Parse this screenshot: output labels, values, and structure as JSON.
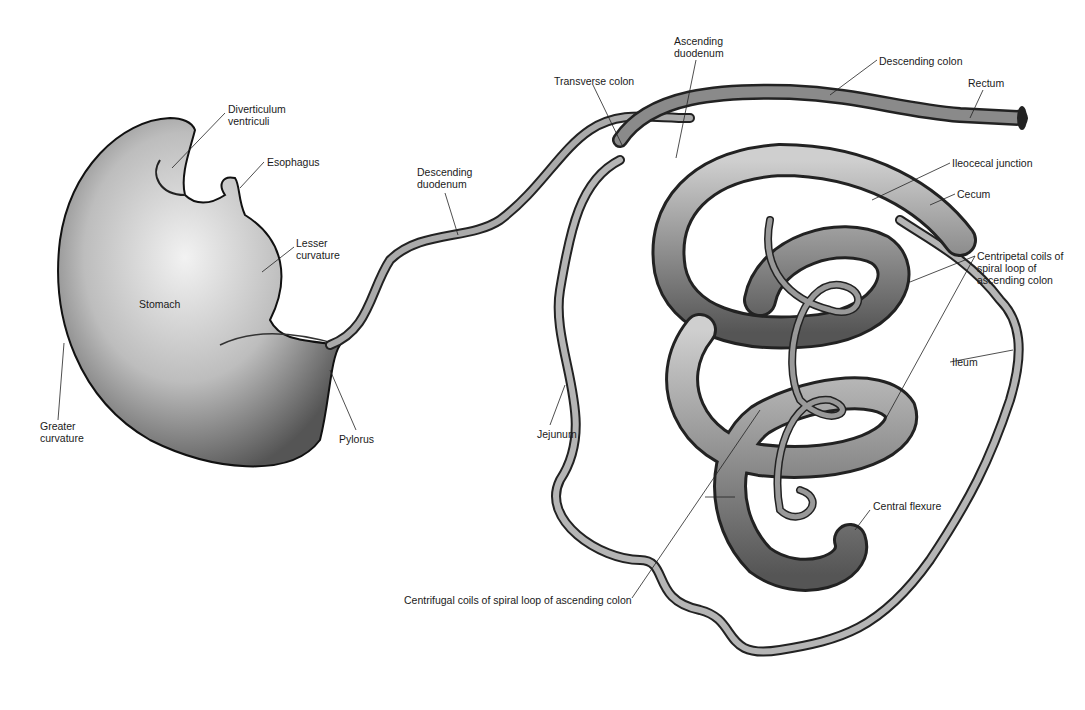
{
  "diagram": {
    "labels": [
      {
        "id": "diverticulum",
        "text": "Diverticulum\nventriculi",
        "x": 228,
        "y": 103
      },
      {
        "id": "esophagus",
        "text": "Esophagus",
        "x": 267,
        "y": 156
      },
      {
        "id": "lesser-curvature",
        "text": "Lesser\ncurvature",
        "x": 296,
        "y": 237
      },
      {
        "id": "stomach",
        "text": "Stomach",
        "x": 139,
        "y": 298
      },
      {
        "id": "greater-curvature",
        "text": "Greater\ncurvature",
        "x": 40,
        "y": 420
      },
      {
        "id": "pylorus",
        "text": "Pylorus",
        "x": 339,
        "y": 433
      },
      {
        "id": "descending-duodenum",
        "text": "Descending\nduodenum",
        "x": 417,
        "y": 166
      },
      {
        "id": "transverse-colon",
        "text": "Transverse colon",
        "x": 554,
        "y": 75
      },
      {
        "id": "ascending-duodenum",
        "text": "Ascending\nduodenum",
        "x": 674,
        "y": 35
      },
      {
        "id": "descending-colon",
        "text": "Descending colon",
        "x": 879,
        "y": 55
      },
      {
        "id": "rectum",
        "text": "Rectum",
        "x": 968,
        "y": 77
      },
      {
        "id": "ileocecal-junction",
        "text": "Ileocecal junction",
        "x": 952,
        "y": 157
      },
      {
        "id": "cecum",
        "text": "Cecum",
        "x": 957,
        "y": 188
      },
      {
        "id": "centripetal-coils",
        "text": "Centripetal coils of\nspiral loop of\nascending colon",
        "x": 977,
        "y": 250
      },
      {
        "id": "ileum",
        "text": "Ileum",
        "x": 952,
        "y": 356
      },
      {
        "id": "jejunum",
        "text": "Jejunum",
        "x": 537,
        "y": 428
      },
      {
        "id": "central-flexure",
        "text": "Central flexure",
        "x": 873,
        "y": 500
      },
      {
        "id": "centrifugal-coils",
        "text": "Centrifugal coils of spiral loop of ascending colon",
        "x": 404,
        "y": 594
      }
    ]
  }
}
